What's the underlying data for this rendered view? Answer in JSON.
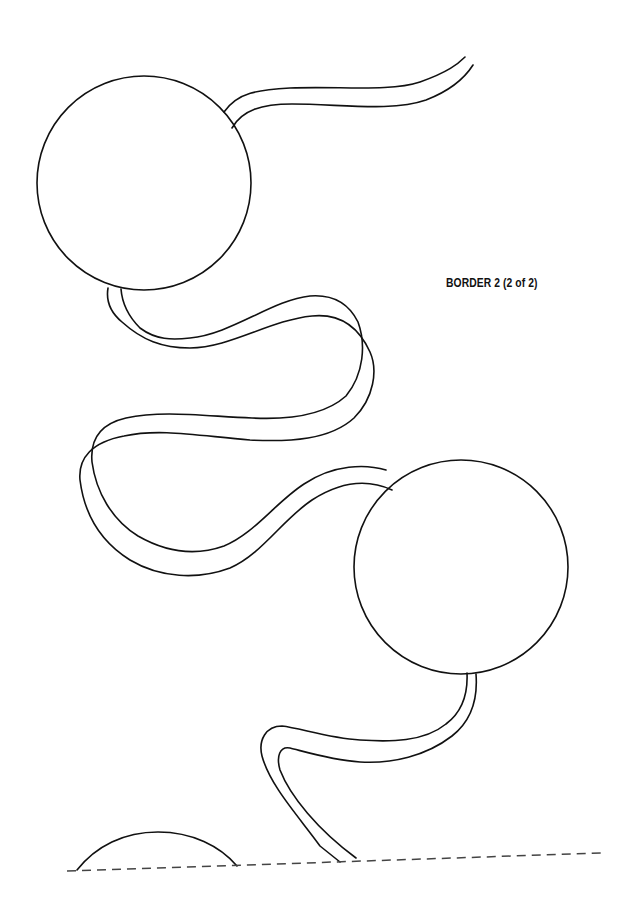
{
  "page": {
    "caption": "BORDER 2 (2 of 2)"
  },
  "colors": {
    "line": "#111111",
    "dash": "#444444",
    "background": "#ffffff"
  },
  "drawing": {
    "circles": [
      {
        "name": "circle-top-left",
        "cx": 144,
        "cy": 183,
        "r": 107
      },
      {
        "name": "circle-middle-right",
        "cx": 461,
        "cy": 567,
        "r": 107
      }
    ],
    "partial_circle": {
      "name": "circle-bottom-partial",
      "start": [
        77,
        870
      ],
      "peak": [
        158,
        832
      ],
      "end": [
        237,
        866
      ]
    },
    "cut_line": {
      "style": "dashed",
      "from": [
        67,
        871
      ],
      "to": [
        602,
        853
      ]
    }
  }
}
